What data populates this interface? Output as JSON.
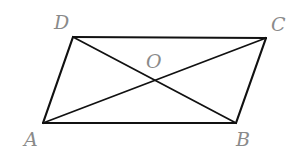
{
  "figure": {
    "type": "parallelogram-with-diagonals",
    "points": {
      "A": {
        "label": "A",
        "x": 43,
        "y": 123,
        "lx": 24,
        "ly": 146
      },
      "B": {
        "label": "B",
        "x": 236,
        "y": 123,
        "lx": 236,
        "ly": 146
      },
      "C": {
        "label": "C",
        "x": 266,
        "y": 38,
        "lx": 271,
        "ly": 31
      },
      "D": {
        "label": "D",
        "x": 73,
        "y": 37,
        "lx": 54,
        "ly": 29
      },
      "O": {
        "label": "O",
        "x": 154,
        "y": 80,
        "lx": 146,
        "ly": 68
      }
    },
    "sides": [
      [
        "A",
        "B"
      ],
      [
        "B",
        "C"
      ],
      [
        "C",
        "D"
      ],
      [
        "D",
        "A"
      ]
    ],
    "diagonals": [
      [
        "A",
        "C"
      ],
      [
        "B",
        "D"
      ]
    ],
    "colors": {
      "line": "#111111",
      "label": "#8a8a8a",
      "background": "#ffffff"
    }
  }
}
